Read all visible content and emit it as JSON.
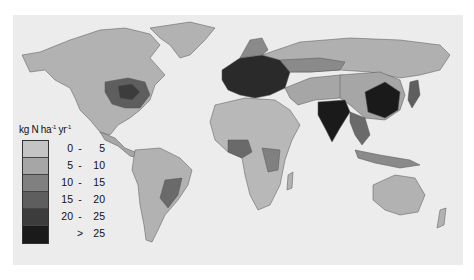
{
  "map": {
    "type": "choropleth",
    "subject": "Global nitrogen deposition",
    "color_scheme": "grayscale",
    "background": "#ececec"
  },
  "legend": {
    "unit_base": "kg N ha",
    "unit_ha_exp": "-1",
    "unit_yr": "yr",
    "unit_yr_exp": "-1",
    "classes": [
      {
        "lo": "0",
        "sep": "-",
        "hi": "5",
        "color": "#c4c4c4"
      },
      {
        "lo": "5",
        "sep": "-",
        "hi": "10",
        "color": "#a6a6a6"
      },
      {
        "lo": "10",
        "sep": "-",
        "hi": "15",
        "color": "#808080"
      },
      {
        "lo": "15",
        "sep": "-",
        "hi": "20",
        "color": "#5e5e5e"
      },
      {
        "lo": "20",
        "sep": "-",
        "hi": "25",
        "color": "#3c3c3c"
      },
      {
        "lo": "",
        "sep": ">",
        "hi": "25",
        "color": "#1a1a1a"
      }
    ]
  },
  "regions_highest": [
    "Europe",
    "Eastern China",
    "India",
    "Eastern United States"
  ]
}
